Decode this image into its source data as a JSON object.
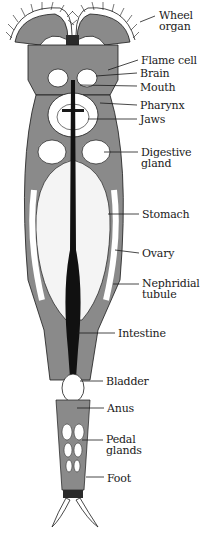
{
  "colors": {
    "ink": "#1a1a1a",
    "body_gray": "#8a8a8a",
    "light_gray": "#bdbdbd",
    "white": "#ffffff"
  },
  "labels": [
    {
      "id": "wheel-organ",
      "text": "Wheel\norgan",
      "x": 159,
      "y": 10,
      "line": [
        [
          155,
          16
        ],
        [
          140,
          22
        ]
      ]
    },
    {
      "id": "flame-cell",
      "text": "Flame cell",
      "x": 141,
      "y": 55,
      "line": [
        [
          138,
          60
        ],
        [
          108,
          70
        ]
      ]
    },
    {
      "id": "brain",
      "text": "Brain",
      "x": 140,
      "y": 68,
      "line": [
        [
          137,
          73
        ],
        [
          96,
          76
        ]
      ]
    },
    {
      "id": "mouth",
      "text": "Mouth",
      "x": 140,
      "y": 82,
      "line": [
        [
          137,
          86
        ],
        [
          80,
          85
        ]
      ]
    },
    {
      "id": "pharynx",
      "text": "Pharynx",
      "x": 140,
      "y": 100,
      "line": [
        [
          137,
          105
        ],
        [
          100,
          103
        ]
      ]
    },
    {
      "id": "jaws",
      "text": "Jaws",
      "x": 140,
      "y": 114,
      "line": [
        [
          137,
          119
        ],
        [
          88,
          119
        ]
      ]
    },
    {
      "id": "digestive-gland",
      "text": "Digestive\ngland",
      "x": 141,
      "y": 147,
      "line": [
        [
          138,
          152
        ],
        [
          104,
          152
        ]
      ]
    },
    {
      "id": "stomach",
      "text": "Stomach",
      "x": 142,
      "y": 209,
      "line": [
        [
          139,
          214
        ],
        [
          108,
          214
        ]
      ]
    },
    {
      "id": "ovary",
      "text": "Ovary",
      "x": 142,
      "y": 248,
      "line": [
        [
          139,
          253
        ],
        [
          115,
          250
        ]
      ]
    },
    {
      "id": "nephridial-tubule",
      "text": "Nephridial\ntubule",
      "x": 142,
      "y": 278,
      "line": [
        [
          139,
          284
        ],
        [
          113,
          284
        ]
      ]
    },
    {
      "id": "intestine",
      "text": "Intestine",
      "x": 118,
      "y": 328,
      "line": [
        [
          115,
          333
        ],
        [
          77,
          333
        ]
      ]
    },
    {
      "id": "bladder",
      "text": "Bladder",
      "x": 106,
      "y": 376,
      "line": [
        [
          103,
          381
        ],
        [
          80,
          381
        ]
      ]
    },
    {
      "id": "anus",
      "text": "Anus",
      "x": 107,
      "y": 403,
      "line": [
        [
          104,
          408
        ],
        [
          77,
          408
        ]
      ]
    },
    {
      "id": "pedal-glands",
      "text": "Pedal\nglands",
      "x": 106,
      "y": 434,
      "line": [
        [
          103,
          440
        ],
        [
          82,
          440
        ]
      ]
    },
    {
      "id": "foot",
      "text": "Foot",
      "x": 107,
      "y": 473,
      "line": [
        [
          104,
          477
        ],
        [
          86,
          477
        ]
      ]
    }
  ]
}
